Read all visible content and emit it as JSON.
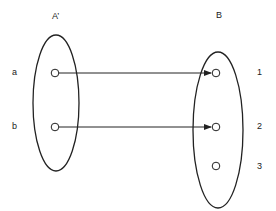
{
  "diagram": {
    "set_a": {
      "label": "A’",
      "elements": [
        "a",
        "b"
      ]
    },
    "set_b": {
      "label": "B",
      "elements": [
        "1",
        "2",
        "3"
      ]
    },
    "mappings": [
      {
        "from": "a",
        "to": "1"
      },
      {
        "from": "b",
        "to": "2"
      }
    ],
    "colors": {
      "stroke": "#222222",
      "background": "#ffffff"
    }
  }
}
